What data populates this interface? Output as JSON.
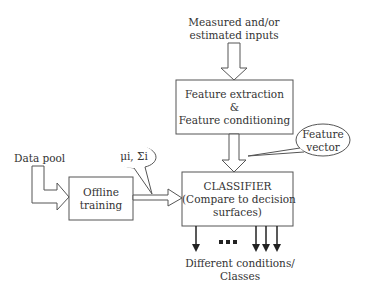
{
  "diagram": {
    "title": "",
    "nodes": {
      "inputs": {
        "line1": "Measured and/or",
        "line2": "estimated inputs"
      },
      "feature_box": {
        "line1": "Feature extraction",
        "line2": "&",
        "line3": "Feature conditioning"
      },
      "classifier_box": {
        "line1": "CLASSIFIER",
        "line2": "(Compare to decision",
        "line3": "surfaces)"
      },
      "offline_box": {
        "line1": "Offline",
        "line2": "training"
      },
      "data_pool": {
        "label": "Data pool"
      },
      "params_callout": {
        "label": "μi, Σi"
      },
      "feature_vector_callout": {
        "line1": "Feature",
        "line2": "vector"
      },
      "outputs": {
        "dots": "...",
        "line1": "Different conditions/",
        "line2": "Classes"
      }
    },
    "edges": [
      {
        "from": "inputs",
        "to": "feature_box",
        "style": "hollow-arrow"
      },
      {
        "from": "feature_box",
        "to": "classifier_box",
        "style": "hollow-arrow"
      },
      {
        "from": "data_pool",
        "to": "offline_box",
        "style": "hollow-arrow"
      },
      {
        "from": "offline_box",
        "to": "classifier_box",
        "style": "hollow-arrow"
      },
      {
        "from": "classifier_box",
        "to": "outputs",
        "style": "solid-arrows",
        "count": 4
      }
    ],
    "colors": {
      "stroke": "#444444",
      "text": "#333333",
      "background": "#ffffff"
    }
  }
}
